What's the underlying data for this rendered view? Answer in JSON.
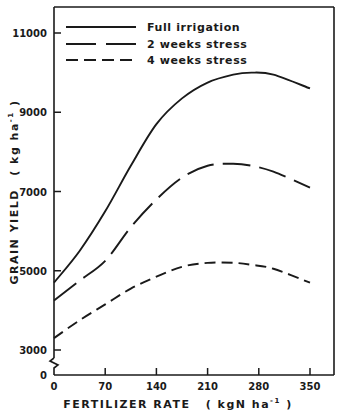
{
  "chart_data": {
    "type": "line",
    "title": "",
    "xlabel": "FERTILIZER RATE",
    "xlabel_unit": "( kgN ha",
    "xlabel_unit_sup": "-1",
    "xlabel_unit_close": " )",
    "ylabel": "GRAIN YIELD",
    "ylabel_unit": "( kg ha",
    "ylabel_unit_sup": "-1",
    "ylabel_unit_close": " )",
    "xlim": [
      0,
      390
    ],
    "ylim": [
      0,
      11700
    ],
    "y_axis_break": [
      0,
      3000
    ],
    "x_ticks": [
      0,
      70,
      140,
      210,
      280,
      350
    ],
    "x_tick_labels": [
      "0",
      "70",
      "140",
      "210",
      "280",
      "350"
    ],
    "y_ticks": [
      0,
      3000,
      5000,
      7000,
      9000,
      11000
    ],
    "y_tick_labels": [
      "0",
      "3000",
      "5000",
      "7000",
      "9000",
      "11000"
    ],
    "grid": false,
    "legend_position": "upper left",
    "x": [
      0,
      35,
      70,
      105,
      140,
      175,
      210,
      245,
      270,
      300,
      350
    ],
    "series": [
      {
        "name": "Full irrigation",
        "style": "solid",
        "values": [
          4700,
          5500,
          6500,
          7650,
          8700,
          9350,
          9750,
          9950,
          10000,
          9950,
          9600
        ]
      },
      {
        "name": "2 weeks stress",
        "style": "long-dash",
        "values": [
          4250,
          4750,
          5250,
          6100,
          6800,
          7350,
          7650,
          7700,
          7650,
          7500,
          7100
        ]
      },
      {
        "name": "4 weeks stress",
        "style": "short-dash",
        "values": [
          3300,
          3750,
          4150,
          4550,
          4850,
          5100,
          5200,
          5200,
          5150,
          5050,
          4700
        ]
      }
    ]
  },
  "legend": {
    "items": [
      {
        "label": "Full irrigation",
        "style": "solid"
      },
      {
        "label": "2 weeks stress",
        "style": "long-dash"
      },
      {
        "label": "4 weeks stress",
        "style": "short-dash"
      }
    ]
  },
  "colors": {
    "ink": "#1a1a1a",
    "background": "#ffffff"
  }
}
